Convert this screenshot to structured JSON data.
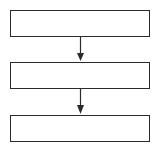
{
  "diagram": {
    "type": "flowchart",
    "direction": "top-to-bottom",
    "nodes": [
      {
        "id": "box-1",
        "label": ""
      },
      {
        "id": "box-2",
        "label": ""
      },
      {
        "id": "box-3",
        "label": ""
      }
    ],
    "edges": [
      {
        "from": "box-1",
        "to": "box-2"
      },
      {
        "from": "box-2",
        "to": "box-3"
      }
    ],
    "colors": {
      "stroke": "#2b2b2b",
      "background": "#ffffff"
    }
  }
}
